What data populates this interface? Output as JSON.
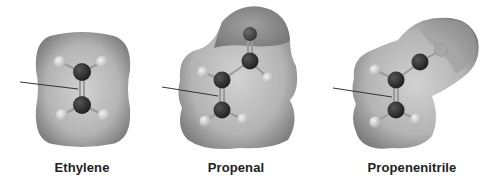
{
  "figure": {
    "molecules": [
      {
        "name": "Ethylene",
        "label_x": 82
      },
      {
        "name": "Propenal",
        "label_x": 236
      },
      {
        "name": "Propenenitrile",
        "label_x": 412
      }
    ],
    "colors": {
      "surface_light": "#cfcfcf",
      "surface_dark": "#7a7a7a",
      "carbon": "#2b2b2b",
      "hydrogen": "#d8d8d8",
      "heteroatom": "#4a4a4a",
      "arrow": "#333333",
      "label": "#222222"
    }
  }
}
